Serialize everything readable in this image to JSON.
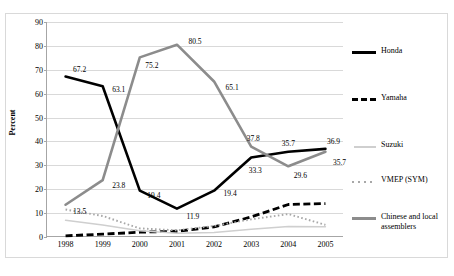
{
  "chart_data": {
    "type": "line",
    "title": "",
    "xlabel": "",
    "ylabel": "Percent",
    "categories": [
      "1998",
      "1999",
      "2000",
      "2001",
      "2002",
      "2003",
      "2004",
      "2005"
    ],
    "ylim": [
      0,
      90
    ],
    "yticks": [
      0,
      10,
      20,
      30,
      40,
      50,
      60,
      70,
      80,
      90
    ],
    "grid": true,
    "legend_position": "right",
    "series": [
      {
        "name": "Honda",
        "style": "solid-thick-black",
        "color": "#000000",
        "values": [
          67.2,
          63.1,
          19.4,
          11.9,
          19.4,
          33.3,
          35.7,
          36.9
        ],
        "labels": [
          "67.2",
          "63.1",
          "19.4",
          "11.9",
          "19.4",
          "33.3",
          "35.7",
          "36.9"
        ]
      },
      {
        "name": "Yamaha",
        "style": "dashed-thick-black",
        "color": "#000000",
        "values": [
          0.5,
          1.2,
          2.0,
          2.4,
          4.2,
          8.4,
          13.6,
          14.0
        ],
        "labels": [
          "",
          "",
          "",
          "",
          "",
          "",
          "",
          ""
        ]
      },
      {
        "name": "Suzuki",
        "style": "solid-thin-lightgray",
        "color": "#cfcfcf",
        "values": [
          7.0,
          5.0,
          2.6,
          1.6,
          1.9,
          3.2,
          4.4,
          4.3
        ],
        "labels": [
          "",
          "",
          "",
          "",
          "",
          "",
          "",
          ""
        ]
      },
      {
        "name": "VMEP (SYM)",
        "style": "dotted-gray",
        "color": "#a8a8a8",
        "values": [
          11.5,
          8.8,
          3.6,
          2.8,
          4.6,
          7.4,
          9.6,
          5.1
        ],
        "labels": [
          "",
          "",
          "",
          "",
          "",
          "",
          "",
          ""
        ]
      },
      {
        "name": "Chinese and local assemblers",
        "style": "solid-thick-gray",
        "color": "#8c8c8c",
        "values": [
          13.5,
          23.8,
          75.2,
          80.5,
          65.1,
          37.8,
          29.6,
          35.7
        ],
        "labels": [
          "13.5",
          "23.8",
          "75.2",
          "80.5",
          "65.1",
          "37.8",
          "29.6",
          "35.7"
        ]
      }
    ]
  },
  "legend": {
    "items": [
      {
        "label": "Honda",
        "key": "solid-black"
      },
      {
        "label": "Yamaha",
        "key": "dash-black"
      },
      {
        "label": "Suzuki",
        "key": "solid-ltgray"
      },
      {
        "label": "VMEP (SYM)",
        "key": "dot-gray"
      },
      {
        "label": "Chinese and local assemblers",
        "key": "solid-gray"
      }
    ]
  },
  "axis": {
    "y_title": "Percent"
  }
}
